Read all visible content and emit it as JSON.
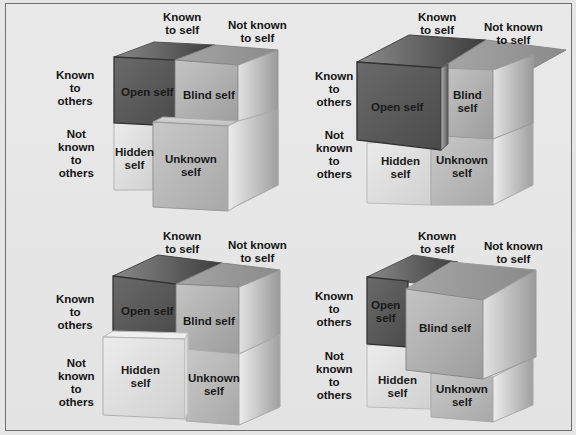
{
  "diagram": {
    "column_headers": {
      "known_to_self": [
        "Known",
        "to self"
      ],
      "not_known_to_self": [
        "Not known",
        "to self"
      ]
    },
    "row_headers": {
      "known_to_others": [
        "Known",
        "to",
        "others"
      ],
      "not_known_to_others": [
        "Not",
        "known",
        "to",
        "others"
      ]
    },
    "quadrants": {
      "open": "Open self",
      "blind": "Blind self",
      "hidden": "Hidden self",
      "unknown": "Unknown self"
    },
    "panels": [
      {
        "id": "panel-1",
        "enlarged": "unknown",
        "cells": {
          "open": [
            "Open self"
          ],
          "blind": [
            "Blind self"
          ],
          "hidden": [
            "Hidden",
            "self"
          ],
          "unknown": [
            "Unknown",
            "self"
          ]
        }
      },
      {
        "id": "panel-2",
        "enlarged": "open",
        "cells": {
          "open": [
            "Open self"
          ],
          "blind": [
            "Blind",
            "self"
          ],
          "hidden": [
            "Hidden",
            "self"
          ],
          "unknown": [
            "Unknown",
            "self"
          ]
        }
      },
      {
        "id": "panel-3",
        "enlarged": "hidden",
        "cells": {
          "open": [
            "Open self"
          ],
          "blind": [
            "Blind self"
          ],
          "hidden": [
            "Hidden",
            "self"
          ],
          "unknown": [
            "Unknown",
            "self"
          ]
        }
      },
      {
        "id": "panel-4",
        "enlarged": "blind",
        "cells": {
          "open": [
            "Open",
            "self"
          ],
          "blind": [
            "Blind self"
          ],
          "hidden": [
            "Hidden",
            "self"
          ],
          "unknown": [
            "Unknown",
            "self"
          ]
        }
      }
    ],
    "colors": {
      "background": "#e6e6e6",
      "border": "#6e6e6e",
      "open_dark": "#5a5a5a",
      "blind_mid": "#a8a8a8",
      "hidden_light": "#dcdcdc",
      "unknown_mid": "#b9b9b9",
      "text": "#141414"
    }
  }
}
